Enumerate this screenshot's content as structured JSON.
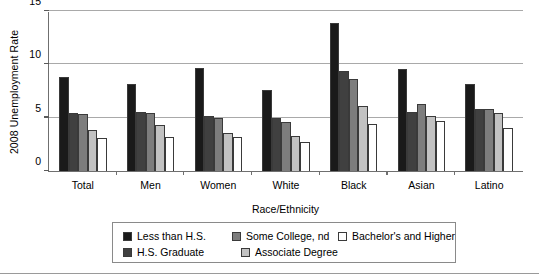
{
  "chart_data": {
    "type": "bar",
    "title": "",
    "xlabel": "Race/Ethnicity",
    "ylabel": "2008 Unemployment Rate",
    "ylim": [
      0,
      15
    ],
    "yticks": [
      0,
      5,
      10,
      15
    ],
    "grid": true,
    "legend_position": "bottom",
    "categories": [
      "Total",
      "Men",
      "Women",
      "White",
      "Black",
      "Asian",
      "Latino"
    ],
    "series": [
      {
        "name": "Less than H.S.",
        "color": "#1a1a1a",
        "values": [
          8.8,
          8.2,
          9.7,
          7.6,
          13.9,
          9.6,
          8.2
        ]
      },
      {
        "name": "H.S. Graduate",
        "color": "#404040",
        "values": [
          5.4,
          5.5,
          5.2,
          5.0,
          9.4,
          5.5,
          5.8
        ]
      },
      {
        "name": "Some College, nd",
        "color": "#7d7d7d",
        "values": [
          5.3,
          5.4,
          5.0,
          4.6,
          8.6,
          6.3,
          5.8
        ]
      },
      {
        "name": "Associate Degree",
        "color": "#c2c2c2",
        "values": [
          3.8,
          4.3,
          3.6,
          3.3,
          6.1,
          5.2,
          5.4
        ]
      },
      {
        "name": "Bachelor's and Higher",
        "color": "#ffffff",
        "values": [
          3.1,
          3.2,
          3.2,
          2.7,
          4.4,
          4.7,
          4.0
        ]
      }
    ]
  }
}
